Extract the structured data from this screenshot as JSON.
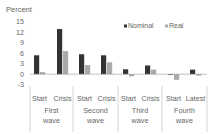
{
  "chart_data": {
    "type": "bar",
    "title": "",
    "ylabel": "Percent",
    "xlabel": "",
    "ylim": [
      -3,
      15
    ],
    "yticks": [
      15,
      12,
      9,
      6,
      3,
      0,
      -3
    ],
    "grid": false,
    "legend_position": "top-right",
    "groups": [
      {
        "label_line1": "First",
        "label_line2": "wave",
        "categories": [
          "Start",
          "Crisis"
        ]
      },
      {
        "label_line1": "Second",
        "label_line2": "wave",
        "categories": [
          "Start",
          "Crisis"
        ]
      },
      {
        "label_line1": "Third",
        "label_line2": "wave",
        "categories": [
          "Start",
          "Crisis"
        ]
      },
      {
        "label_line1": "Fourth",
        "label_line2": "wave",
        "categories": [
          "Start",
          "Latest"
        ]
      }
    ],
    "categories": [
      "Start",
      "Crisis",
      "Start",
      "Crisis",
      "Start",
      "Crisis",
      "Start",
      "Latest"
    ],
    "series": [
      {
        "name": "Nominal",
        "color": "#333333",
        "values": [
          5.4,
          12.9,
          5.7,
          5.4,
          1.4,
          2.5,
          -0.2,
          1.3
        ]
      },
      {
        "name": "Real",
        "color": "#aaaaaa",
        "values": [
          0.6,
          6.6,
          2.6,
          3.4,
          -0.6,
          1.3,
          -1.6,
          -0.4
        ]
      }
    ]
  }
}
